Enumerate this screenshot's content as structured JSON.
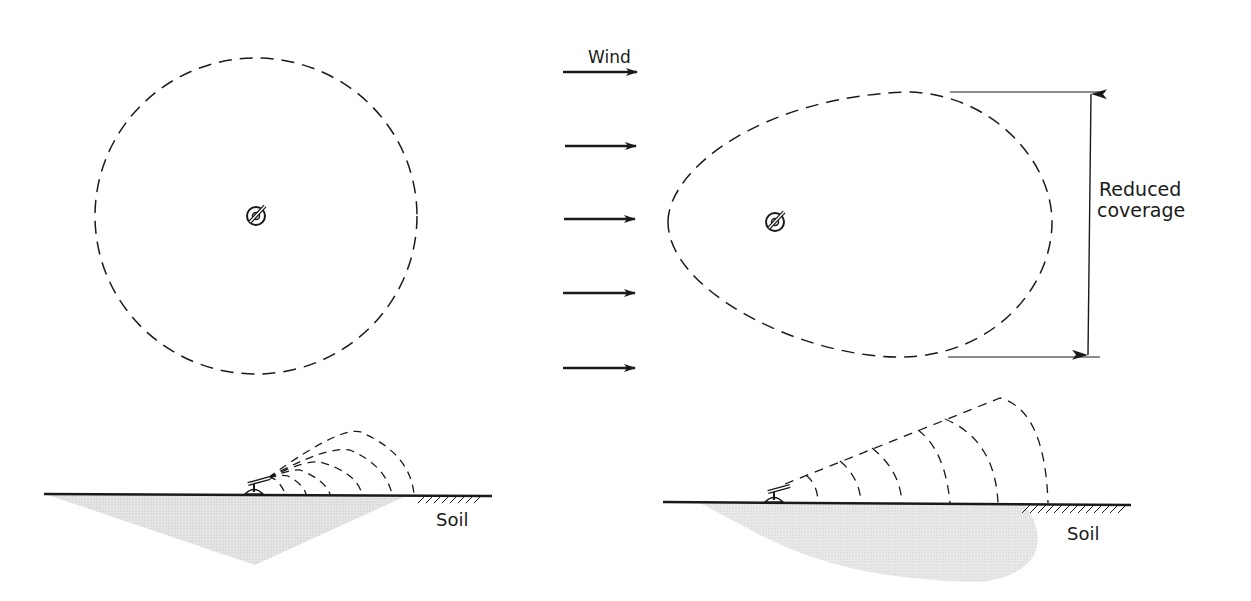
{
  "figure": {
    "colors": {
      "ink": "#1a1a1a",
      "wetted_soil": "#d6d6d6",
      "background": "#ffffff"
    }
  },
  "labels": {
    "wind": "Wind",
    "reduced_coverage_line1": "Reduced",
    "reduced_coverage_line2": "coverage",
    "soil_left": "Soil",
    "soil_right": "Soil"
  },
  "panels": {
    "no_wind_plan": {
      "shape": "circle",
      "description": "Circular wetted pattern, no wind"
    },
    "wind_plan": {
      "shape": "egg",
      "description": "Elongated pattern downwind, reduced width"
    },
    "wind_arrows": {
      "count": 5,
      "direction": "right"
    },
    "no_wind_profile": {
      "trajectories": 5
    },
    "wind_profile": {
      "trajectories": 6
    }
  }
}
